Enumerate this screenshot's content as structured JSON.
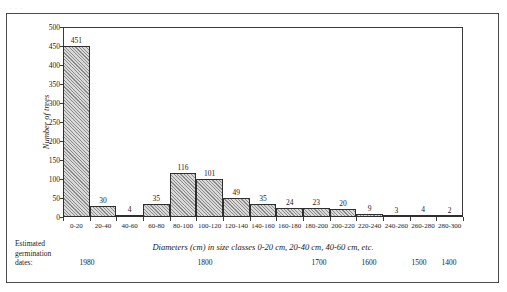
{
  "figure": {
    "scan_artifact_text": "·   ·    ·        ·                    ·"
  },
  "axis": {
    "y_label": "Number of trees",
    "y_ticks": [
      0,
      50,
      100,
      150,
      200,
      250,
      300,
      350,
      400,
      450,
      500
    ],
    "x_caption": "Diameters (cm) in size classes 0-20 cm, 20-40 cm, 40-60 cm, etc."
  },
  "germination": {
    "title_line1": "Estimated",
    "title_line2": "germination",
    "title_line3": "dates:",
    "years": [
      {
        "label": "1980",
        "position_pct": 6.0
      },
      {
        "label": "1800",
        "position_pct": 35.5
      },
      {
        "label": "1700",
        "position_pct": 64.0
      },
      {
        "label": "1600",
        "position_pct": 76.5
      },
      {
        "label": "1500",
        "position_pct": 89.0
      },
      {
        "label": "1400",
        "position_pct": 96.5
      }
    ]
  },
  "chart_data": {
    "type": "bar",
    "title": "",
    "xlabel": "Diameters (cm) in size classes 0-20 cm, 20-40 cm, 40-60 cm, etc.",
    "ylabel": "Number of trees",
    "ylim": [
      0,
      500
    ],
    "ytick_step": 50,
    "grid": false,
    "legend": false,
    "categories": [
      "0-20",
      "20-40",
      "40-60",
      "60-80",
      "80-100",
      "100-120",
      "120-140",
      "140-160",
      "160-180",
      "180-200",
      "200-220",
      "220-240",
      "240-260",
      "260-280",
      "280-300"
    ],
    "values": [
      451,
      30,
      4,
      35,
      116,
      101,
      49,
      35,
      24,
      23,
      20,
      9,
      3,
      4,
      2
    ]
  }
}
